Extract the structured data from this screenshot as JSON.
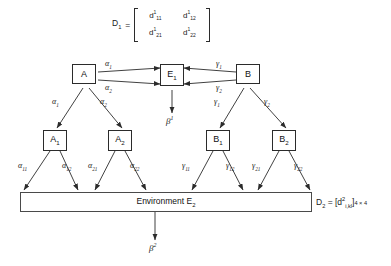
{
  "diagram": {
    "matrix_top": {
      "name": "D",
      "name_sub": "1",
      "equals": "=",
      "cells": [
        {
          "base": "d",
          "sup": "1",
          "sub": "11"
        },
        {
          "base": "d",
          "sup": "1",
          "sub": "12"
        },
        {
          "base": "d",
          "sup": "1",
          "sub": "21"
        },
        {
          "base": "d",
          "sup": "1",
          "sub": "22"
        }
      ]
    },
    "nodes": {
      "a": {
        "label": "A"
      },
      "e1": {
        "label": "E",
        "sub": "1"
      },
      "b": {
        "label": "B"
      },
      "a1": {
        "label": "A",
        "sub": "1"
      },
      "a2": {
        "label": "A",
        "sub": "2"
      },
      "b1": {
        "label": "B",
        "sub": "1"
      },
      "b2": {
        "label": "B",
        "sub": "2"
      }
    },
    "environment": {
      "label": "Environment E",
      "sub": "2"
    },
    "matrix_bottom": {
      "text": "D",
      "sub": "2",
      "equals": " = [d",
      "sup": "2",
      "idx": "i,kl",
      "close": "]",
      "dims": "4 × 4"
    },
    "edge_labels": {
      "a_to_e1_upper": {
        "base": "α",
        "sub": "1"
      },
      "a_to_e1_lower": {
        "base": "α",
        "sub": "2"
      },
      "b_to_e1_upper": {
        "base": "γ",
        "sub": "1"
      },
      "b_to_e1_lower": {
        "base": "γ",
        "sub": "2"
      },
      "a_to_a1": {
        "base": "α",
        "sub": "1"
      },
      "a_to_a2": {
        "base": "α",
        "sub": "2"
      },
      "b_to_b1": {
        "base": "γ",
        "sub": "1"
      },
      "b_to_b2": {
        "base": "γ",
        "sub": "2"
      },
      "a1_left": {
        "base": "α",
        "sub": "11"
      },
      "a1_right": {
        "base": "α",
        "sub": "12"
      },
      "a2_left": {
        "base": "α",
        "sub": "21"
      },
      "a2_right": {
        "base": "α",
        "sub": "22"
      },
      "b1_left": {
        "base": "γ",
        "sub": "11"
      },
      "b1_right": {
        "base": "γ",
        "sub": "12"
      },
      "b2_left": {
        "base": "γ",
        "sub": "21"
      },
      "b2_right": {
        "base": "γ",
        "sub": "22"
      }
    },
    "outputs": {
      "beta1": {
        "base": "β",
        "sup": "1"
      },
      "beta2": {
        "base": "β",
        "sup": "2"
      }
    },
    "colors": {
      "stroke": "#2b2b2b",
      "text": "#111111",
      "background": "#ffffff"
    }
  }
}
